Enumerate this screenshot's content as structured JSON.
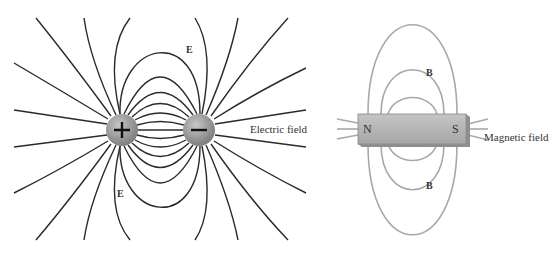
{
  "electric_panel": {
    "charges": [
      {
        "sign": "+",
        "label": "positive-charge"
      },
      {
        "sign": "−",
        "label": "negative-charge"
      }
    ],
    "field_symbol_top": "E",
    "field_symbol_bottom": "E",
    "caption": "Electric field",
    "line_color": "#2a2a2a",
    "charge_color": "#9a9a9a"
  },
  "magnetic_panel": {
    "north_label": "N",
    "south_label": "S",
    "field_symbol_top": "B",
    "field_symbol_bottom": "B",
    "caption": "Magnetic field",
    "line_color": "#a8a8a8",
    "magnet_color": "#b5b5b5"
  }
}
